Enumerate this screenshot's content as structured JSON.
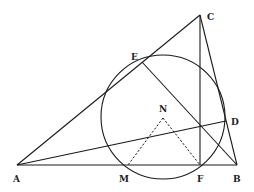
{
  "diagram": {
    "type": "geometry",
    "points": {
      "A": {
        "label": "A",
        "x": 17,
        "y": 165
      },
      "B": {
        "label": "B",
        "x": 237,
        "y": 165
      },
      "C": {
        "label": "C",
        "x": 200,
        "y": 15
      },
      "D": {
        "label": "D",
        "x": 226,
        "y": 121
      },
      "E": {
        "label": "E",
        "x": 142,
        "y": 62
      },
      "F": {
        "label": "F",
        "x": 200,
        "y": 165
      },
      "M": {
        "label": "M",
        "x": 128,
        "y": 165
      },
      "N": {
        "label": "N",
        "x": 163,
        "y": 118
      }
    },
    "circle": {
      "cx": 163,
      "cy": 117,
      "r": 62
    },
    "segments_solid": [
      [
        "A",
        "B"
      ],
      [
        "A",
        "C"
      ],
      [
        "C",
        "B"
      ],
      [
        "C",
        "F"
      ],
      [
        "E",
        "B"
      ],
      [
        "A",
        "D"
      ]
    ],
    "segments_dashed": [
      [
        "N",
        "M"
      ],
      [
        "N",
        "F"
      ]
    ]
  }
}
